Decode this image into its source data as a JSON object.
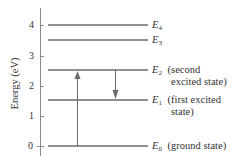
{
  "diagram": {
    "y_axis": {
      "label": "Energy (eV)",
      "ticks": [
        "0",
        "1",
        "2",
        "3",
        "4"
      ],
      "range": [
        0,
        4.5
      ]
    },
    "levels": [
      {
        "name": "E0",
        "symbol": "E",
        "subscript": "0",
        "energy_eV": 0,
        "description": "(ground state)",
        "description_line2": ""
      },
      {
        "name": "E1",
        "symbol": "E",
        "subscript": "1",
        "energy_eV": 1.5,
        "description": "(first excited",
        "description_line2": "state)"
      },
      {
        "name": "E2",
        "symbol": "E",
        "subscript": "2",
        "energy_eV": 2.5,
        "description": "(second",
        "description_line2": "excited state)"
      },
      {
        "name": "E3",
        "symbol": "E",
        "subscript": "3",
        "energy_eV": 3.5,
        "description": "",
        "description_line2": ""
      },
      {
        "name": "E4",
        "symbol": "E",
        "subscript": "4",
        "energy_eV": 4.0,
        "description": "",
        "description_line2": ""
      }
    ],
    "transitions": [
      {
        "from": "E0",
        "to": "E2",
        "direction": "up",
        "type": "absorption"
      },
      {
        "from": "E2",
        "to": "E1",
        "direction": "down",
        "type": "emission"
      }
    ],
    "colors": {
      "line": "#6b6b6b",
      "axis": "#8a8a8a",
      "text": "#333333",
      "background": "#ffffff"
    }
  }
}
